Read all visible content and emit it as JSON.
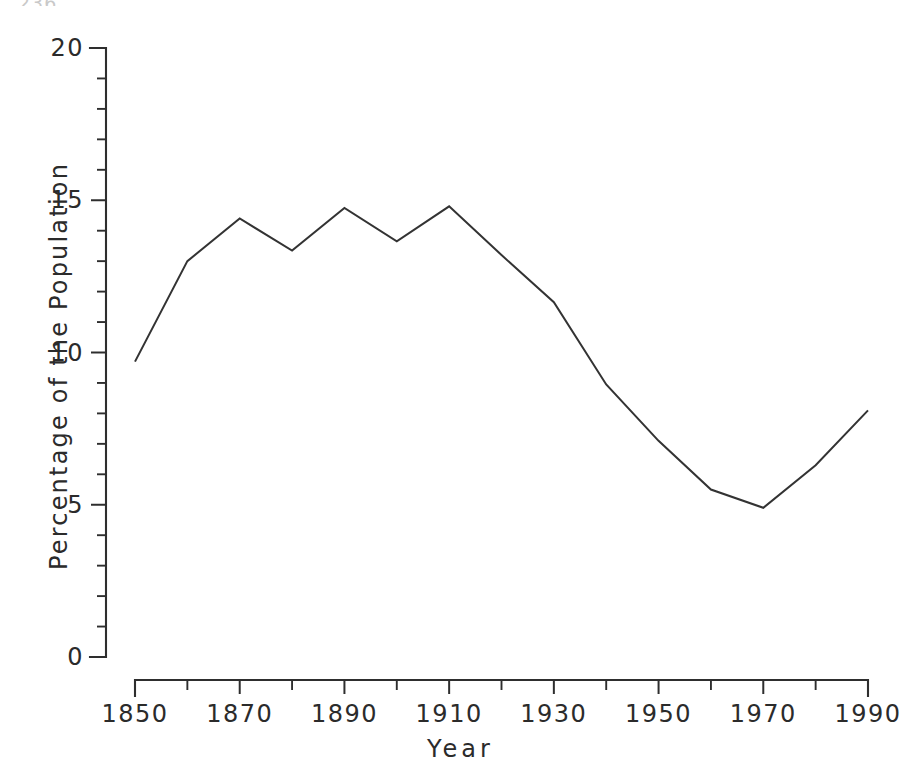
{
  "page": {
    "header_fragment": "236",
    "background_color": "#ffffff",
    "ink_color": "#2e2e2e"
  },
  "chart_data": {
    "type": "line",
    "title": "",
    "subtitle": "",
    "xlabel": "Year",
    "ylabel": "Percentage of the Population",
    "xlim": [
      1850,
      1990
    ],
    "ylim": [
      0,
      20
    ],
    "grid": false,
    "legend": null,
    "legend_position": "none",
    "line_color": "#333333",
    "x_major_ticks": [
      1850,
      1870,
      1890,
      1910,
      1930,
      1950,
      1970,
      1990
    ],
    "x_major_tick_labels": [
      "1850",
      "1870",
      "1890",
      "1910",
      "1930",
      "1950",
      "1970",
      "1990"
    ],
    "x_minor_ticks": [
      1860,
      1880,
      1900,
      1920,
      1940,
      1960,
      1980
    ],
    "y_major_ticks": [
      0,
      5,
      10,
      15,
      20
    ],
    "y_major_tick_labels": [
      "0",
      "5",
      "10",
      "15",
      "20"
    ],
    "y_minor_ticks": [
      1,
      2,
      3,
      4,
      6,
      7,
      8,
      9,
      11,
      12,
      13,
      14,
      16,
      17,
      18,
      19
    ],
    "x": [
      1850,
      1860,
      1870,
      1880,
      1890,
      1900,
      1910,
      1920,
      1930,
      1940,
      1950,
      1960,
      1970,
      1980,
      1990
    ],
    "values": [
      9.7,
      13.0,
      14.4,
      13.35,
      14.75,
      13.65,
      14.8,
      13.2,
      11.65,
      8.95,
      7.1,
      5.5,
      4.9,
      6.3,
      8.1
    ],
    "series": [
      {
        "name": "Percentage of the Population",
        "values": [
          9.7,
          13.0,
          14.4,
          13.35,
          14.75,
          13.65,
          14.8,
          13.2,
          11.65,
          8.95,
          7.1,
          5.5,
          4.9,
          6.3,
          8.1
        ]
      }
    ]
  }
}
